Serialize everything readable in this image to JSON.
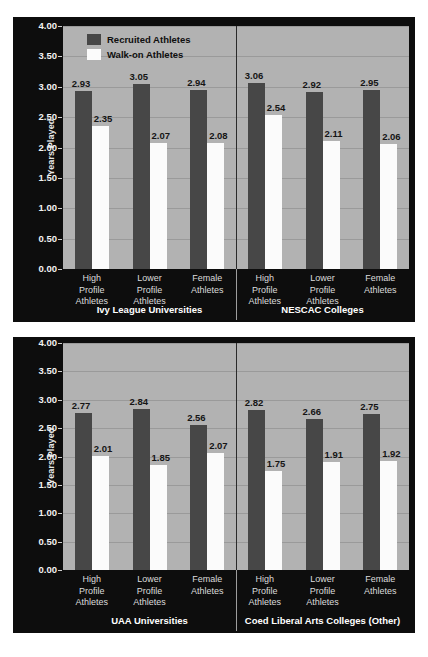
{
  "chart_data": [
    {
      "type": "bar",
      "title": "",
      "xlabel": "",
      "ylabel": "Years Played",
      "ylim": [
        0,
        4.0
      ],
      "ytick_labels": [
        "0.00",
        "0.50",
        "1.00",
        "1.50",
        "2.00",
        "2.50",
        "3.00",
        "3.50",
        "4.00"
      ],
      "ytick_values": [
        0,
        0.5,
        1.0,
        1.5,
        2.0,
        2.5,
        3.0,
        3.5,
        4.0
      ],
      "grid": true,
      "legend_position": "top-left",
      "legend": [
        "Recruited Athletes",
        "Walk-on Athletes"
      ],
      "panel_groups": [
        {
          "group_title": "Ivy League Universities",
          "categories": [
            "High\nProfile\nAthletes",
            "Lower\nProfile\nAthletes",
            "Female\nAthletes"
          ],
          "series": [
            {
              "name": "Recruited Athletes",
              "values": [
                2.93,
                3.05,
                2.94
              ]
            },
            {
              "name": "Walk-on Athletes",
              "values": [
                2.35,
                2.07,
                2.08
              ]
            }
          ]
        },
        {
          "group_title": "NESCAC Colleges",
          "categories": [
            "High\nProfile\nAthletes",
            "Lower\nProfile\nAthletes",
            "Female\nAthletes"
          ],
          "series": [
            {
              "name": "Recruited Athletes",
              "values": [
                3.06,
                2.92,
                2.95
              ]
            },
            {
              "name": "Walk-on Athletes",
              "values": [
                2.54,
                2.11,
                2.06
              ]
            }
          ]
        }
      ]
    },
    {
      "type": "bar",
      "title": "",
      "xlabel": "",
      "ylabel": "Years Played",
      "ylim": [
        0,
        4.0
      ],
      "ytick_labels": [
        "0.00",
        "0.50",
        "1.00",
        "1.50",
        "2.00",
        "2.50",
        "3.00",
        "3.50",
        "4.00"
      ],
      "ytick_values": [
        0,
        0.5,
        1.0,
        1.5,
        2.0,
        2.5,
        3.0,
        3.5,
        4.0
      ],
      "grid": true,
      "legend_position": "none",
      "legend": [],
      "panel_groups": [
        {
          "group_title": "UAA Universities",
          "categories": [
            "High\nProfile\nAthletes",
            "Lower\nProfile\nAthletes",
            "Female\nAthletes"
          ],
          "series": [
            {
              "name": "Recruited Athletes",
              "values": [
                2.77,
                2.84,
                2.56
              ]
            },
            {
              "name": "Walk-on Athletes",
              "values": [
                2.01,
                1.85,
                2.07
              ]
            }
          ]
        },
        {
          "group_title": "Coed Liberal Arts Colleges (Other)",
          "categories": [
            "High\nProfile\nAthletes",
            "Lower\nProfile\nAthletes",
            "Female\nAthletes"
          ],
          "series": [
            {
              "name": "Recruited Athletes",
              "values": [
                2.82,
                2.66,
                2.75
              ]
            },
            {
              "name": "Walk-on Athletes",
              "values": [
                1.75,
                1.91,
                1.92
              ]
            }
          ]
        }
      ]
    }
  ],
  "colors": {
    "recruited_bar": "#474747",
    "walkon_bar": "#fbfbfb",
    "plot_background": "#b2b2b2",
    "panel_background": "#0d0d0d",
    "gridline": "#9a9a9a",
    "axis_text": "#f2f2f2",
    "value_label": "#151515"
  }
}
